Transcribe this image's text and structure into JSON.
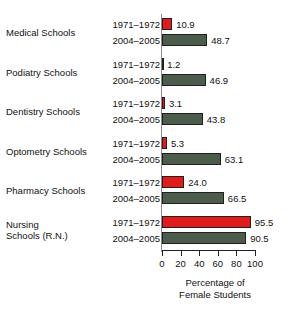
{
  "chart_data": {
    "type": "bar",
    "orientation": "horizontal",
    "title": "",
    "xlabel": "Percentage of\nFemale Students",
    "ylabel": "",
    "xlim": [
      0,
      100
    ],
    "xticks": [
      0,
      20,
      40,
      60,
      80,
      100
    ],
    "xtick_labels": [
      "0",
      "20",
      "40",
      "60",
      "80",
      "100"
    ],
    "grid": false,
    "legend": false,
    "categories": [
      "Medical Schools",
      "Podiatry Schools",
      "Dentistry Schools",
      "Optometry Schools",
      "Pharmacy Schools",
      "Nursing\nSchools (R.N.)"
    ],
    "series": [
      {
        "name": "1971–1972",
        "color": "#e01b1b",
        "values": [
          10.9,
          1.2,
          3.1,
          5.3,
          24.0,
          95.5
        ]
      },
      {
        "name": "2004–2005",
        "color": "#4c5c4a",
        "values": [
          48.7,
          46.9,
          43.8,
          63.1,
          66.5,
          90.5
        ]
      }
    ],
    "data_labels": [
      [
        "10.9",
        "48.7"
      ],
      [
        "1.2",
        "46.9"
      ],
      [
        "3.1",
        "43.8"
      ],
      [
        "5.3",
        "63.1"
      ],
      [
        "24.0",
        "66.5"
      ],
      [
        "95.5",
        "90.5"
      ]
    ]
  },
  "groups": [
    {
      "category": "Medical Schools",
      "label_lines": 1,
      "bars": [
        {
          "period": "1971–1972",
          "value": 10.9,
          "label": "10.9",
          "color_key": "c-red"
        },
        {
          "period": "2004–2005",
          "value": 48.7,
          "label": "48.7",
          "color_key": "c-green"
        }
      ]
    },
    {
      "category": "Podiatry Schools",
      "label_lines": 1,
      "bars": [
        {
          "period": "1971–1972",
          "value": 1.2,
          "label": "1.2",
          "color_key": "c-red"
        },
        {
          "period": "2004–2005",
          "value": 46.9,
          "label": "46.9",
          "color_key": "c-green"
        }
      ]
    },
    {
      "category": "Dentistry Schools",
      "label_lines": 1,
      "bars": [
        {
          "period": "1971–1972",
          "value": 3.1,
          "label": "3.1",
          "color_key": "c-red"
        },
        {
          "period": "2004–2005",
          "value": 43.8,
          "label": "43.8",
          "color_key": "c-green"
        }
      ]
    },
    {
      "category": "Optometry Schools",
      "label_lines": 1,
      "bars": [
        {
          "period": "1971–1972",
          "value": 5.3,
          "label": "5.3",
          "color_key": "c-red"
        },
        {
          "period": "2004–2005",
          "value": 63.1,
          "label": "63.1",
          "color_key": "c-green"
        }
      ]
    },
    {
      "category": "Pharmacy Schools",
      "label_lines": 1,
      "bars": [
        {
          "period": "1971–1972",
          "value": 24.0,
          "label": "24.0",
          "color_key": "c-red"
        },
        {
          "period": "2004–2005",
          "value": 66.5,
          "label": "66.5",
          "color_key": "c-green"
        }
      ]
    },
    {
      "category": "Nursing\nSchools (R.N.)",
      "label_lines": 2,
      "bars": [
        {
          "period": "1971–1972",
          "value": 95.5,
          "label": "95.5",
          "color_key": "c-red"
        },
        {
          "period": "2004–2005",
          "value": 90.5,
          "label": "90.5",
          "color_key": "c-green"
        }
      ]
    }
  ],
  "axis": {
    "ticks": [
      "0",
      "20",
      "40",
      "60",
      "80",
      "100"
    ],
    "title": "Percentage of\nFemale Students"
  },
  "colors": {
    "series_1971": "#e01b1b",
    "series_2004": "#4c5c4a",
    "bar_outline": "#231f20",
    "axis": "#231f20",
    "text": "#111111",
    "background": "#ffffff"
  }
}
